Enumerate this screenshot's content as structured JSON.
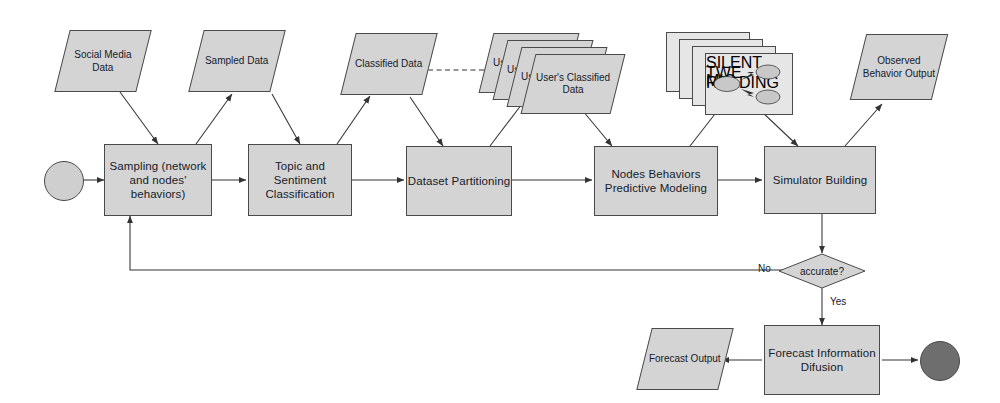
{
  "diagram": {
    "colors": {
      "node_fill": "#d4d4d4",
      "sheet_fill": "#e6e6e6",
      "stroke": "#4a4a4a",
      "text": "#15202b",
      "start_circle": "#cfcfcf",
      "end_circle": "#6e6e6e"
    },
    "data_nodes": {
      "social_media_data": "Social Media Data",
      "sampled_data": "Sampled Data",
      "classified_data": "Classified Data",
      "users_classified_data": "User's Classified Data",
      "users_classified_data_partial": "Us",
      "observed_behavior_output": "Observed Behavior Output",
      "forecast_output": "Forecast Output"
    },
    "process_nodes": {
      "sampling": "Sampling (network and nodes' behaviors)",
      "topic_sentiment": "Topic and Sentiment Classification",
      "dataset_partitioning": "Dataset Partitioning",
      "nodes_behaviors": "Nodes Behaviors Predictive Modeling",
      "simulator_building": "Simulator Building",
      "forecast_diffusion": "Forecast Information Difusion"
    },
    "decision": {
      "label": "accurate?",
      "no_label": "No",
      "yes_label": "Yes"
    },
    "mini_diagram": {
      "source": "SILENT MIC",
      "target_top": "TWE",
      "target_bottom": "READING"
    }
  }
}
